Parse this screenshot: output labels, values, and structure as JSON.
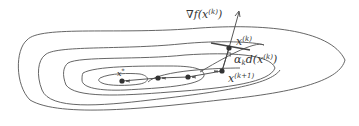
{
  "diagram": {
    "labels": {
      "gradient": "∇f(x",
      "gradient_sup": "(k)",
      "gradient_close": ")",
      "xk": "x",
      "xk_sup": "(k)",
      "step": "α",
      "step_sub": "k",
      "step_d": "d(x",
      "step_sup": "(k)",
      "step_close": ")",
      "xk1": "x",
      "xk1_sup": "(k+1)",
      "xstar": "x",
      "xstar_sup": "*"
    },
    "colors": {
      "line": "#555555",
      "point": "#333333",
      "text": "#333333"
    }
  }
}
